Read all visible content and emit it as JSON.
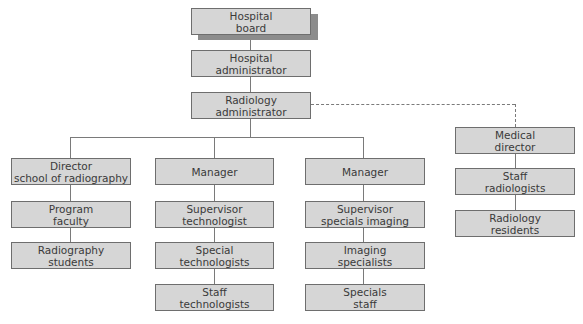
{
  "diagram": {
    "type": "organizational-chart",
    "colors": {
      "box_fill": "#d6d6d6",
      "box_border": "#6e6e6e",
      "shadow": "#8c8c8c",
      "line": "#7a7a7a",
      "text": "#3a3a3a"
    },
    "top": {
      "board": "Hospital\nboard",
      "hospital_admin": "Hospital\nadministrator",
      "radiology_admin": "Radiology\nadministrator"
    },
    "columns": [
      {
        "head": "Director\nschool of radiography",
        "items": [
          "Program\nfaculty",
          "Radiography\nstudents"
        ]
      },
      {
        "head": "Manager",
        "items": [
          "Supervisor\ntechnologist",
          "Special\ntechnologists",
          "Staff\ntechnologists"
        ]
      },
      {
        "head": "Manager",
        "items": [
          "Supervisor\nspecials imaging",
          "Imaging\nspecialists",
          "Specials\nstaff"
        ]
      },
      {
        "head": "Medical\ndirector",
        "items": [
          "Staff\nradiologists",
          "Radiology\nresidents"
        ]
      }
    ],
    "connections": {
      "solid": "reports-to",
      "dashed": "Radiology administrator to Medical director (advisory)"
    }
  }
}
